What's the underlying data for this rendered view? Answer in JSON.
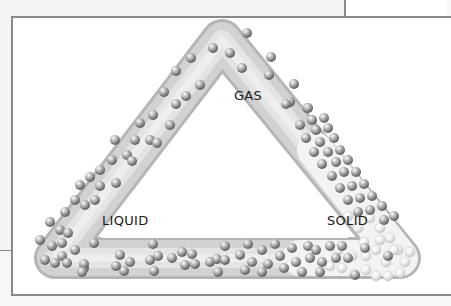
{
  "diagram": {
    "labels": {
      "gas": "GAS",
      "liquid": "LIQUID",
      "solid": "SOLID"
    },
    "colors": {
      "frame_border": "#8a8a8a",
      "tube": "#d9d9d9",
      "particle": "#9a9a9a",
      "solid_particle": "#ececec",
      "text": "#1a1a1a"
    }
  }
}
